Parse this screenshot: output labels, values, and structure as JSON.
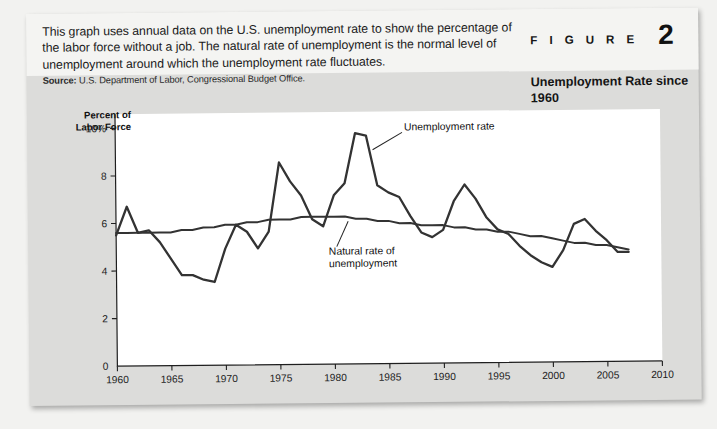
{
  "figure": {
    "kicker": "F I G U R E",
    "number": "2",
    "title": "Unemployment Rate since 1960",
    "caption": "This graph uses annual data on the U.S. unemployment rate to show the percentage of the labor force without a job. The natural rate of unemployment is the normal level of unemployment around which the unemployment rate fluctuates.",
    "source_label": "Source:",
    "source_text": "U.S. Department of Labor, Congressional Budget Office."
  },
  "chart_data": {
    "type": "line",
    "title": "Unemployment Rate since 1960",
    "xlabel": "",
    "ylabel": "Percent of Labor Force",
    "xlim": [
      1960,
      2010
    ],
    "ylim": [
      0,
      10.6
    ],
    "grid": false,
    "legend_position": "inline-annotations",
    "xticks": [
      "1960",
      "1965",
      "1970",
      "1975",
      "1980",
      "1985",
      "1990",
      "1995",
      "2000",
      "2005",
      "2010"
    ],
    "xtick_values": [
      1960,
      1965,
      1970,
      1975,
      1980,
      1985,
      1990,
      1995,
      2000,
      2005,
      2010
    ],
    "yticks": [
      "0",
      "2",
      "4",
      "6",
      "8",
      "10%"
    ],
    "ytick_values": [
      0,
      2,
      4,
      6,
      8,
      10
    ],
    "annotations": [
      {
        "text": "Unemployment rate",
        "x": 1986.5,
        "y": 9.8
      },
      {
        "text": "Natural rate of unemployment",
        "x": 1979.5,
        "y": 4.6
      }
    ],
    "x": [
      1960,
      1961,
      1962,
      1963,
      1964,
      1965,
      1966,
      1967,
      1968,
      1969,
      1970,
      1971,
      1972,
      1973,
      1974,
      1975,
      1976,
      1977,
      1978,
      1979,
      1980,
      1981,
      1982,
      1983,
      1984,
      1985,
      1986,
      1987,
      1988,
      1989,
      1990,
      1991,
      1992,
      1993,
      1994,
      1995,
      1996,
      1997,
      1998,
      1999,
      2000,
      2001,
      2002,
      2003,
      2004,
      2005,
      2006,
      2007
    ],
    "series": [
      {
        "name": "Unemployment rate",
        "color": "#333333",
        "values": [
          5.5,
          6.7,
          5.6,
          5.7,
          5.2,
          4.5,
          3.8,
          3.8,
          3.6,
          3.5,
          4.9,
          5.9,
          5.6,
          4.9,
          5.6,
          8.5,
          7.7,
          7.1,
          6.1,
          5.8,
          7.1,
          7.6,
          9.7,
          9.6,
          7.5,
          7.2,
          7.0,
          6.2,
          5.5,
          5.3,
          5.6,
          6.8,
          7.5,
          6.9,
          6.1,
          5.6,
          5.4,
          4.9,
          4.5,
          4.2,
          4.0,
          4.7,
          5.8,
          6.0,
          5.5,
          5.1,
          4.6,
          4.6
        ]
      },
      {
        "name": "Natural rate of unemployment",
        "color": "#333333",
        "values": [
          5.6,
          5.6,
          5.6,
          5.6,
          5.6,
          5.6,
          5.7,
          5.7,
          5.8,
          5.8,
          5.9,
          5.9,
          6.0,
          6.0,
          6.1,
          6.1,
          6.1,
          6.2,
          6.2,
          6.2,
          6.2,
          6.2,
          6.1,
          6.1,
          6.0,
          6.0,
          5.9,
          5.9,
          5.8,
          5.8,
          5.8,
          5.7,
          5.7,
          5.6,
          5.6,
          5.5,
          5.5,
          5.4,
          5.3,
          5.3,
          5.2,
          5.1,
          5.0,
          5.0,
          4.9,
          4.9,
          4.8,
          4.7
        ]
      }
    ]
  }
}
